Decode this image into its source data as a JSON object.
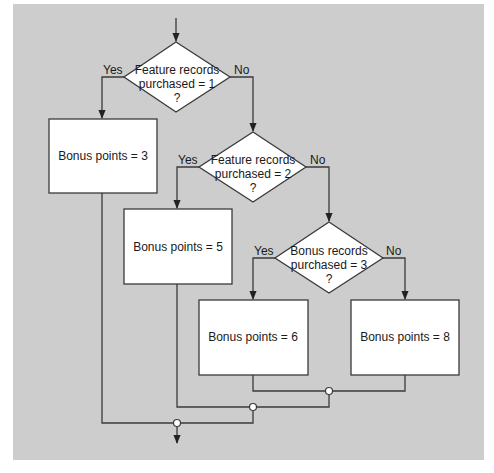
{
  "colors": {
    "panel_background": "#cdcdcd",
    "line": "#3a3a3a",
    "shape_fill": "#ffffff",
    "junction_fill": "#ffffff"
  },
  "decisions": [
    {
      "id": "d1",
      "lines": [
        "Feature records",
        "purchased = 1",
        "?"
      ],
      "yes_label": "Yes",
      "no_label": "No"
    },
    {
      "id": "d2",
      "lines": [
        "Feature records",
        "purchased = 2",
        "?"
      ],
      "yes_label": "Yes",
      "no_label": "No"
    },
    {
      "id": "d3",
      "lines": [
        "Bonus records",
        "purchased = 3",
        "?"
      ],
      "yes_label": "Yes",
      "no_label": "No"
    }
  ],
  "processes": [
    {
      "id": "p3",
      "label": "Bonus points = 3"
    },
    {
      "id": "p5",
      "label": "Bonus points = 5"
    },
    {
      "id": "p6",
      "label": "Bonus points = 6"
    },
    {
      "id": "p8",
      "label": "Bonus points = 8"
    }
  ]
}
